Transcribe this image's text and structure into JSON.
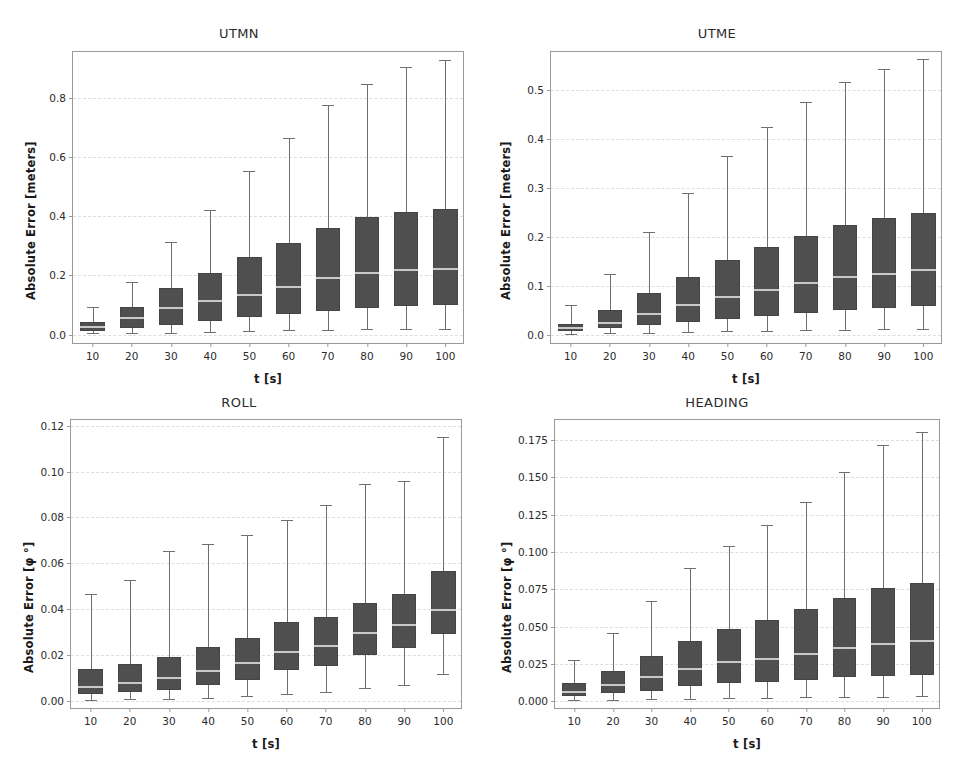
{
  "figure": {
    "layout": "2x2-grid",
    "background": "#ffffff",
    "box_color": "#4f4f4f",
    "median_color": "#c9c9c9",
    "whisker_color": "#6f6f6f",
    "grid_color": "#dedede",
    "axis_color": "#9a9a9a"
  },
  "chart_data": [
    {
      "type": "box",
      "id": "utmn",
      "title": "UTMN",
      "xlabel": "t [s]",
      "ylabel": "Absolute Error [meters]",
      "categories": [
        "10",
        "20",
        "30",
        "40",
        "50",
        "60",
        "70",
        "80",
        "90",
        "100"
      ],
      "ylim": [
        -0.035,
        0.955
      ],
      "yticks": [
        0.0,
        0.2,
        0.4,
        0.6,
        0.8
      ],
      "ytick_labels": [
        "0.0",
        "0.2",
        "0.4",
        "0.6",
        "0.8"
      ],
      "grid": true,
      "boxes": [
        {
          "category": "10",
          "whisker_low": 0.004,
          "q1": 0.012,
          "median": 0.025,
          "q3": 0.042,
          "whisker_high": 0.092
        },
        {
          "category": "20",
          "whisker_low": 0.004,
          "q1": 0.022,
          "median": 0.056,
          "q3": 0.092,
          "whisker_high": 0.178
        },
        {
          "category": "30",
          "whisker_low": 0.007,
          "q1": 0.034,
          "median": 0.09,
          "q3": 0.156,
          "whisker_high": 0.313
        },
        {
          "category": "40",
          "whisker_low": 0.009,
          "q1": 0.046,
          "median": 0.113,
          "q3": 0.207,
          "whisker_high": 0.421
        },
        {
          "category": "50",
          "whisker_low": 0.011,
          "q1": 0.06,
          "median": 0.135,
          "q3": 0.261,
          "whisker_high": 0.553
        },
        {
          "category": "60",
          "whisker_low": 0.014,
          "q1": 0.071,
          "median": 0.16,
          "q3": 0.311,
          "whisker_high": 0.663
        },
        {
          "category": "70",
          "whisker_low": 0.017,
          "q1": 0.079,
          "median": 0.19,
          "q3": 0.361,
          "whisker_high": 0.775
        },
        {
          "category": "80",
          "whisker_low": 0.019,
          "q1": 0.09,
          "median": 0.207,
          "q3": 0.398,
          "whisker_high": 0.848
        },
        {
          "category": "90",
          "whisker_low": 0.019,
          "q1": 0.096,
          "median": 0.22,
          "q3": 0.416,
          "whisker_high": 0.905
        },
        {
          "category": "100",
          "whisker_low": 0.02,
          "q1": 0.1,
          "median": 0.222,
          "q3": 0.426,
          "whisker_high": 0.928
        }
      ]
    },
    {
      "type": "box",
      "id": "utme",
      "title": "UTME",
      "xlabel": "t [s]",
      "ylabel": "Absolute Error [meters]",
      "categories": [
        "10",
        "20",
        "30",
        "40",
        "50",
        "60",
        "70",
        "80",
        "90",
        "100"
      ],
      "ylim": [
        -0.021,
        0.578
      ],
      "yticks": [
        0.0,
        0.1,
        0.2,
        0.3,
        0.4,
        0.5
      ],
      "ytick_labels": [
        "0.0",
        "0.1",
        "0.2",
        "0.3",
        "0.4",
        "0.5"
      ],
      "grid": true,
      "boxes": [
        {
          "category": "10",
          "whisker_low": 0.002,
          "q1": 0.007,
          "median": 0.013,
          "q3": 0.022,
          "whisker_high": 0.06
        },
        {
          "category": "20",
          "whisker_low": 0.003,
          "q1": 0.013,
          "median": 0.023,
          "q3": 0.05,
          "whisker_high": 0.124
        },
        {
          "category": "30",
          "whisker_low": 0.004,
          "q1": 0.019,
          "median": 0.043,
          "q3": 0.086,
          "whisker_high": 0.21
        },
        {
          "category": "40",
          "whisker_low": 0.005,
          "q1": 0.025,
          "median": 0.06,
          "q3": 0.118,
          "whisker_high": 0.289
        },
        {
          "category": "50",
          "whisker_low": 0.007,
          "q1": 0.032,
          "median": 0.078,
          "q3": 0.153,
          "whisker_high": 0.365
        },
        {
          "category": "60",
          "whisker_low": 0.008,
          "q1": 0.039,
          "median": 0.091,
          "q3": 0.18,
          "whisker_high": 0.425
        },
        {
          "category": "70",
          "whisker_low": 0.009,
          "q1": 0.044,
          "median": 0.106,
          "q3": 0.202,
          "whisker_high": 0.475
        },
        {
          "category": "80",
          "whisker_low": 0.01,
          "q1": 0.051,
          "median": 0.119,
          "q3": 0.224,
          "whisker_high": 0.516
        },
        {
          "category": "90",
          "whisker_low": 0.011,
          "q1": 0.055,
          "median": 0.125,
          "q3": 0.238,
          "whisker_high": 0.543
        },
        {
          "category": "100",
          "whisker_low": 0.012,
          "q1": 0.059,
          "median": 0.133,
          "q3": 0.249,
          "whisker_high": 0.563
        }
      ]
    },
    {
      "type": "box",
      "id": "roll",
      "title": "ROLL",
      "xlabel": "t [s]",
      "ylabel": "Absolute Error [φ °]",
      "categories": [
        "10",
        "20",
        "30",
        "40",
        "50",
        "60",
        "70",
        "80",
        "90",
        "100"
      ],
      "ylim": [
        -0.004,
        0.1225
      ],
      "yticks": [
        0.0,
        0.02,
        0.04,
        0.06,
        0.08,
        0.1,
        0.12
      ],
      "ytick_labels": [
        "0.00",
        "0.02",
        "0.04",
        "0.06",
        "0.08",
        "0.10",
        "0.12"
      ],
      "grid": true,
      "boxes": [
        {
          "category": "10",
          "whisker_low": 0.0005,
          "q1": 0.003,
          "median": 0.0062,
          "q3": 0.0139,
          "whisker_high": 0.0466
        },
        {
          "category": "20",
          "whisker_low": 0.0006,
          "q1": 0.0038,
          "median": 0.0079,
          "q3": 0.016,
          "whisker_high": 0.0528
        },
        {
          "category": "30",
          "whisker_low": 0.0009,
          "q1": 0.0048,
          "median": 0.0101,
          "q3": 0.0193,
          "whisker_high": 0.0655
        },
        {
          "category": "40",
          "whisker_low": 0.0014,
          "q1": 0.007,
          "median": 0.0131,
          "q3": 0.0234,
          "whisker_high": 0.0683
        },
        {
          "category": "50",
          "whisker_low": 0.0021,
          "q1": 0.009,
          "median": 0.0163,
          "q3": 0.0272,
          "whisker_high": 0.0724
        },
        {
          "category": "60",
          "whisker_low": 0.0031,
          "q1": 0.0133,
          "median": 0.0213,
          "q3": 0.0345,
          "whisker_high": 0.0787
        },
        {
          "category": "70",
          "whisker_low": 0.0039,
          "q1": 0.0152,
          "median": 0.0241,
          "q3": 0.0365,
          "whisker_high": 0.0855
        },
        {
          "category": "80",
          "whisker_low": 0.0058,
          "q1": 0.0198,
          "median": 0.0295,
          "q3": 0.0425,
          "whisker_high": 0.0944
        },
        {
          "category": "90",
          "whisker_low": 0.0069,
          "q1": 0.0229,
          "median": 0.0331,
          "q3": 0.0466,
          "whisker_high": 0.0959
        },
        {
          "category": "100",
          "whisker_low": 0.0116,
          "q1": 0.029,
          "median": 0.0397,
          "q3": 0.0567,
          "whisker_high": 0.1149
        }
      ]
    },
    {
      "type": "box",
      "id": "heading",
      "title": "HEADING",
      "xlabel": "t [s]",
      "ylabel": "Absolute Error [φ °]",
      "categories": [
        "10",
        "20",
        "30",
        "40",
        "50",
        "60",
        "70",
        "80",
        "90",
        "100"
      ],
      "ylim": [
        -0.006,
        0.1885
      ],
      "yticks": [
        0.0,
        0.025,
        0.05,
        0.075,
        0.1,
        0.125,
        0.15,
        0.175
      ],
      "ytick_labels": [
        "0.000",
        "0.025",
        "0.050",
        "0.075",
        "0.100",
        "0.125",
        "0.150",
        "0.175"
      ],
      "grid": true,
      "boxes": [
        {
          "category": "10",
          "whisker_low": 0.0007,
          "q1": 0.0032,
          "median": 0.006,
          "q3": 0.0122,
          "whisker_high": 0.0275
        },
        {
          "category": "20",
          "whisker_low": 0.0009,
          "q1": 0.0054,
          "median": 0.0109,
          "q3": 0.0203,
          "whisker_high": 0.0459
        },
        {
          "category": "30",
          "whisker_low": 0.0012,
          "q1": 0.0068,
          "median": 0.0159,
          "q3": 0.0305,
          "whisker_high": 0.0673
        },
        {
          "category": "40",
          "whisker_low": 0.0016,
          "q1": 0.0098,
          "median": 0.0218,
          "q3": 0.0404,
          "whisker_high": 0.089
        },
        {
          "category": "50",
          "whisker_low": 0.0018,
          "q1": 0.0118,
          "median": 0.0262,
          "q3": 0.0484,
          "whisker_high": 0.1043
        },
        {
          "category": "60",
          "whisker_low": 0.0022,
          "q1": 0.0128,
          "median": 0.0284,
          "q3": 0.0546,
          "whisker_high": 0.1182
        },
        {
          "category": "70",
          "whisker_low": 0.0024,
          "q1": 0.0144,
          "median": 0.0317,
          "q3": 0.0618,
          "whisker_high": 0.1337
        },
        {
          "category": "80",
          "whisker_low": 0.0027,
          "q1": 0.0161,
          "median": 0.0356,
          "q3": 0.0692,
          "whisker_high": 0.1533
        },
        {
          "category": "90",
          "whisker_low": 0.003,
          "q1": 0.0167,
          "median": 0.0385,
          "q3": 0.076,
          "whisker_high": 0.1714
        },
        {
          "category": "100",
          "whisker_low": 0.0032,
          "q1": 0.0178,
          "median": 0.0401,
          "q3": 0.0793,
          "whisker_high": 0.1803
        }
      ]
    }
  ]
}
